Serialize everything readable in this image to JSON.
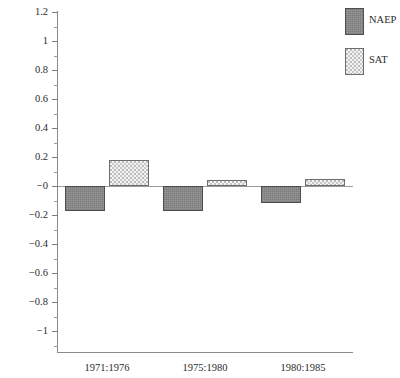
{
  "chart_data": {
    "type": "bar",
    "title": "",
    "subtitle": "",
    "xlabel": "",
    "ylabel": "",
    "categories": [
      "1971:1976",
      "1975:1980",
      "1980:1985"
    ],
    "series": [
      {
        "name": "NAEP",
        "values": [
          -0.17,
          -0.17,
          -0.12
        ],
        "fill": "#8c8c8c",
        "pattern": "solid-gray"
      },
      {
        "name": "SAT",
        "values": [
          0.18,
          0.04,
          0.05
        ],
        "fill": "#f4f4f4",
        "pattern": "dotted"
      }
    ],
    "ylim": [
      -1.2,
      1.2
    ],
    "ytick_labels": [
      "1.2",
      "1",
      "0.8",
      "0.6",
      "0.4",
      "0.2",
      "−0",
      "−0.2",
      "−0.4",
      "−0.6",
      "−0.8",
      "−1"
    ],
    "ytick_values": [
      1.2,
      1.0,
      0.8,
      0.6,
      0.4,
      0.2,
      0.0,
      -0.2,
      -0.4,
      -0.6,
      -0.8,
      -1.0
    ],
    "yminor_values": [
      1.1,
      0.9,
      0.7,
      0.5,
      0.3,
      0.1,
      -0.1,
      -0.3,
      -0.5,
      -0.7,
      -0.9,
      -1.1
    ],
    "grid": false,
    "zero_line": true,
    "legend_position": "top-right",
    "axis_color": "#8a8a8a"
  },
  "legend": {
    "entries": [
      {
        "label": "NAEP",
        "swatch": "naep-swatch"
      },
      {
        "label": "SAT",
        "swatch": "sat-swatch"
      }
    ]
  }
}
